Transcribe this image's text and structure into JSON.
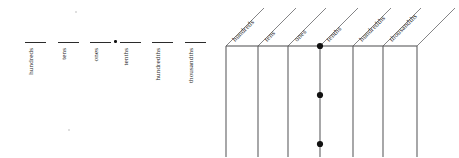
{
  "document": {
    "title": "Place Value Chart Worksheet",
    "type": "place-value-chart"
  },
  "left_diagram": {
    "name": "blank-line place value diagram",
    "decimal_point_symbol": "•",
    "slots": [
      {
        "label": "hundreds",
        "x": 25,
        "y": 42,
        "width": 21
      },
      {
        "label": "tens",
        "x": 58,
        "y": 42,
        "width": 21
      },
      {
        "label": "ones",
        "x": 90,
        "y": 42,
        "width": 21
      },
      {
        "label": "tenths",
        "x": 120,
        "y": 42,
        "width": 21
      },
      {
        "label": "hundredths",
        "x": 152,
        "y": 42,
        "width": 21
      },
      {
        "label": "thousandths",
        "x": 185,
        "y": 42,
        "width": 21
      }
    ],
    "decimal_point": {
      "x": 114,
      "y": 41
    }
  },
  "right_table": {
    "name": "slanted header place value table",
    "columns": [
      {
        "label": "hundreds"
      },
      {
        "label": "tens"
      },
      {
        "label": "ones"
      },
      {
        "label": "tenths"
      },
      {
        "label": "hundredths"
      },
      {
        "label": "thousandths"
      }
    ],
    "column_x": [
      1,
      33,
      63,
      95,
      128,
      158,
      192
    ],
    "header_baseline_y": 46,
    "table_bottom_y": 157,
    "slant_angle_deg": 45,
    "slant_rise": 38,
    "decimal_dots": [
      {
        "x": 95,
        "y": 46
      },
      {
        "x": 95,
        "y": 95
      },
      {
        "x": 95,
        "y": 144
      }
    ],
    "dot_radius": 3.1
  },
  "colors": {
    "ink": "#1f1f1f",
    "rule": "#2b2b2b",
    "table_line": "#58595b",
    "slant_line": "#7d7d80",
    "background": "#ffffff"
  }
}
